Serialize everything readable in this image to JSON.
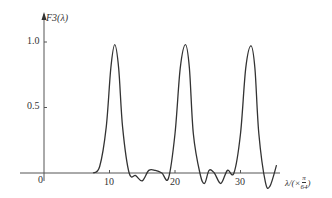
{
  "chart_data": {
    "type": "line",
    "title": "",
    "ylabel": "F3(λ)",
    "xlabel": "λ/(×π/64)",
    "xlabel_parts": {
      "prefix": "λ/(×",
      "num": "π",
      "den": "64",
      "suffix": ")"
    },
    "x_ticks": [
      "10",
      "20",
      "30"
    ],
    "y_ticks": [
      "0.5",
      "1.0"
    ],
    "origin_label": "0",
    "xlim": [
      0,
      36
    ],
    "ylim": [
      0,
      1.1
    ],
    "grid": false,
    "legend": null,
    "series": [
      {
        "name": "F3(λ)",
        "x": [
          7.5,
          8.5,
          9.5,
          10.2,
          10.8,
          11.4,
          12.0,
          13.0,
          14.0,
          15.0,
          16.0,
          17.0,
          18.0,
          19.0,
          20.0,
          20.8,
          21.6,
          22.2,
          22.8,
          23.8,
          24.5,
          25.2,
          26.0,
          27.0,
          28.0,
          29.0,
          30.0,
          30.8,
          31.6,
          32.2,
          32.8,
          33.8,
          34.5,
          35.5
        ],
        "values": [
          0.0,
          0.05,
          0.35,
          0.8,
          0.98,
          0.8,
          0.35,
          0.0,
          -0.02,
          -0.06,
          0.02,
          0.02,
          0.0,
          -0.04,
          0.3,
          0.8,
          0.98,
          0.8,
          0.3,
          0.0,
          -0.08,
          0.02,
          0.0,
          -0.08,
          0.02,
          0.0,
          0.3,
          0.8,
          0.97,
          0.8,
          0.3,
          -0.07,
          -0.1,
          0.06
        ]
      }
    ]
  }
}
